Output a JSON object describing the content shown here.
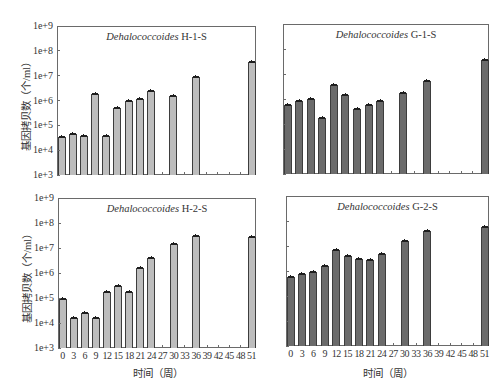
{
  "chart_data": [
    {
      "type": "bar",
      "panel": "top-left",
      "title": "Dehalococcoides H-1-S",
      "title_italic": "Dehalococcoides",
      "title_suffix": "H-1-S",
      "xlabel": "",
      "ylabel": "基因拷贝数（个/ml）",
      "yscale": "log",
      "ylim": [
        1000,
        1000000000
      ],
      "ylim_log": [
        3,
        9
      ],
      "yticks": [
        "1e+3",
        "1e+4",
        "1e+5",
        "1e+6",
        "1e+7",
        "1e+8",
        "1e+9"
      ],
      "show_y_tick_labels": true,
      "show_x_tick_labels": false,
      "categories": [
        "0",
        "3",
        "6",
        "9",
        "12",
        "15",
        "18",
        "21",
        "24",
        "27",
        "30",
        "33",
        "36",
        "39",
        "42",
        "45",
        "48",
        "51"
      ],
      "values": [
        35000,
        46000,
        38000,
        1900000,
        38000,
        500000,
        1000000,
        1100000,
        2500000,
        null,
        1500000,
        null,
        9100000,
        null,
        null,
        null,
        null,
        34000000
      ],
      "bar_color": "#bdbdbd",
      "error_bars": true,
      "grid": false
    },
    {
      "type": "bar",
      "panel": "top-right",
      "title": "Dehalococcoides G-1-S",
      "title_italic": "Dehalococcoides",
      "title_suffix": "G-1-S",
      "xlabel": "",
      "ylabel": "",
      "yscale": "log",
      "ylim": [
        1000,
        1000000000
      ],
      "ylim_log": [
        3,
        9
      ],
      "yticks": [
        "1e+3",
        "1e+4",
        "1e+5",
        "1e+6",
        "1e+7",
        "1e+8",
        "1e+9"
      ],
      "show_y_tick_labels": false,
      "show_x_tick_labels": false,
      "categories": [
        "0",
        "3",
        "6",
        "9",
        "12",
        "15",
        "18",
        "21",
        "24",
        "27",
        "30",
        "33",
        "36",
        "39",
        "42",
        "45",
        "48",
        "51"
      ],
      "values": [
        590000,
        860000,
        970000,
        170000,
        3700000,
        1500000,
        390000,
        580000,
        860000,
        null,
        1700000,
        null,
        5100000,
        null,
        null,
        null,
        null,
        35000000
      ],
      "bar_color": "#6b6b6b",
      "error_bars": true,
      "grid": false
    },
    {
      "type": "bar",
      "panel": "bottom-left",
      "title": "Dehalococcoides H-2-S",
      "title_italic": "Dehalococcoides",
      "title_suffix": "H-2-S",
      "xlabel": "时间（周）",
      "ylabel": "基因拷贝数（个/ml）",
      "yscale": "log",
      "ylim": [
        1000,
        1000000000
      ],
      "ylim_log": [
        3,
        9
      ],
      "yticks": [
        "1e+3",
        "1e+4",
        "1e+5",
        "1e+6",
        "1e+7",
        "1e+8",
        "1e+9"
      ],
      "show_y_tick_labels": true,
      "show_x_tick_labels": true,
      "categories": [
        "0",
        "3",
        "6",
        "9",
        "12",
        "15",
        "18",
        "21",
        "24",
        "27",
        "30",
        "33",
        "36",
        "39",
        "42",
        "45",
        "48",
        "51"
      ],
      "values": [
        93000,
        15500,
        25000,
        16500,
        170000,
        290000,
        180000,
        1550000,
        4000000,
        null,
        15000000,
        null,
        29000000,
        null,
        null,
        null,
        null,
        28000000
      ],
      "bar_color": "#bdbdbd",
      "error_bars": true,
      "grid": false
    },
    {
      "type": "bar",
      "panel": "bottom-right",
      "title": "Dehalococcoides G-2-S",
      "title_italic": "Dehalococcoides",
      "title_suffix": "G-2-S",
      "xlabel": "时间（周）",
      "ylabel": "",
      "yscale": "log",
      "ylim": [
        1000,
        1000000000
      ],
      "ylim_log": [
        3,
        9
      ],
      "yticks": [
        "1e+3",
        "1e+4",
        "1e+5",
        "1e+6",
        "1e+7",
        "1e+8",
        "1e+9"
      ],
      "show_y_tick_labels": false,
      "show_x_tick_labels": true,
      "categories": [
        "0",
        "3",
        "6",
        "9",
        "12",
        "15",
        "18",
        "21",
        "24",
        "27",
        "30",
        "33",
        "36",
        "39",
        "42",
        "45",
        "48",
        "51"
      ],
      "values": [
        590000,
        760000,
        910000,
        1600000,
        6700000,
        4100000,
        3100000,
        2700000,
        4800000,
        null,
        16000000,
        null,
        39000000,
        null,
        null,
        null,
        null,
        56000000
      ],
      "bar_color": "#6b6b6b",
      "error_bars": true,
      "grid": false
    }
  ]
}
